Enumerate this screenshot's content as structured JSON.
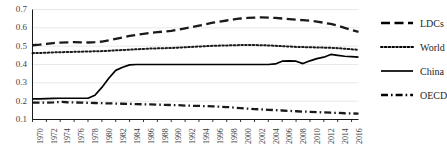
{
  "chart_data": {
    "type": "line",
    "title": "",
    "subtitle": "",
    "xlabel": "",
    "ylabel": "",
    "xlim": [
      1970,
      2017
    ],
    "ylim": [
      0.1,
      0.7
    ],
    "grid": true,
    "grid_axis": "y",
    "legend_position": "right",
    "y_ticks": [
      "0.7",
      "0.6",
      "0.5",
      "0.4",
      "0.3",
      "0.2",
      "0.1"
    ],
    "y_tick_values": [
      0.7,
      0.6,
      0.5,
      0.4,
      0.3,
      0.2,
      0.1
    ],
    "x_ticks": [
      "1970",
      "1972",
      "1974",
      "1976",
      "1978",
      "1980",
      "1982",
      "1984",
      "1986",
      "1988",
      "1990",
      "1992",
      "1994",
      "1996",
      "1998",
      "2000",
      "2002",
      "2004",
      "2006",
      "2008",
      "2010",
      "2012",
      "2014",
      "2016"
    ],
    "x": [
      1970,
      1971,
      1972,
      1973,
      1974,
      1975,
      1976,
      1977,
      1978,
      1979,
      1980,
      1981,
      1982,
      1983,
      1984,
      1985,
      1986,
      1987,
      1988,
      1989,
      1990,
      1991,
      1992,
      1993,
      1994,
      1995,
      1996,
      1997,
      1998,
      1999,
      2000,
      2001,
      2002,
      2003,
      2004,
      2005,
      2006,
      2007,
      2008,
      2009,
      2010,
      2011,
      2012,
      2013,
      2014,
      2015,
      2016,
      2017
    ],
    "series": [
      {
        "name": "LDCs",
        "style": "dashed",
        "color": "#1a1a1a",
        "values": [
          0.505,
          0.508,
          0.512,
          0.517,
          0.519,
          0.521,
          0.522,
          0.521,
          0.52,
          0.522,
          0.525,
          0.532,
          0.54,
          0.548,
          0.556,
          0.562,
          0.567,
          0.572,
          0.576,
          0.58,
          0.584,
          0.59,
          0.597,
          0.604,
          0.612,
          0.62,
          0.628,
          0.634,
          0.64,
          0.646,
          0.651,
          0.654,
          0.656,
          0.657,
          0.656,
          0.654,
          0.651,
          0.648,
          0.644,
          0.642,
          0.639,
          0.634,
          0.628,
          0.621,
          0.612,
          0.6,
          0.588,
          0.578
        ]
      },
      {
        "name": "World",
        "style": "dotted",
        "color": "#1a1a1a",
        "values": [
          0.462,
          0.463,
          0.464,
          0.466,
          0.467,
          0.468,
          0.469,
          0.47,
          0.471,
          0.472,
          0.473,
          0.475,
          0.477,
          0.479,
          0.481,
          0.483,
          0.485,
          0.487,
          0.488,
          0.489,
          0.49,
          0.492,
          0.494,
          0.496,
          0.498,
          0.5,
          0.502,
          0.503,
          0.504,
          0.505,
          0.506,
          0.506,
          0.506,
          0.505,
          0.504,
          0.502,
          0.5,
          0.498,
          0.496,
          0.495,
          0.494,
          0.493,
          0.492,
          0.491,
          0.489,
          0.486,
          0.483,
          0.48
        ]
      },
      {
        "name": "China",
        "style": "solid",
        "color": "#000000",
        "values": [
          0.212,
          0.213,
          0.214,
          0.215,
          0.216,
          0.216,
          0.216,
          0.216,
          0.216,
          0.232,
          0.275,
          0.325,
          0.368,
          0.385,
          0.398,
          0.4,
          0.4,
          0.4,
          0.4,
          0.4,
          0.4,
          0.4,
          0.4,
          0.4,
          0.4,
          0.4,
          0.4,
          0.4,
          0.4,
          0.4,
          0.4,
          0.4,
          0.4,
          0.4,
          0.4,
          0.403,
          0.418,
          0.42,
          0.418,
          0.405,
          0.42,
          0.432,
          0.44,
          0.455,
          0.45,
          0.445,
          0.443,
          0.44
        ]
      },
      {
        "name": "OECD",
        "style": "dashdot",
        "color": "#1a1a1a",
        "values": [
          0.192,
          0.192,
          0.192,
          0.193,
          0.196,
          0.194,
          0.193,
          0.192,
          0.191,
          0.19,
          0.189,
          0.188,
          0.187,
          0.186,
          0.185,
          0.184,
          0.183,
          0.182,
          0.181,
          0.18,
          0.179,
          0.178,
          0.176,
          0.175,
          0.174,
          0.173,
          0.172,
          0.17,
          0.168,
          0.165,
          0.162,
          0.159,
          0.157,
          0.155,
          0.153,
          0.151,
          0.149,
          0.147,
          0.145,
          0.143,
          0.142,
          0.14,
          0.139,
          0.137,
          0.136,
          0.134,
          0.133,
          0.132
        ]
      }
    ]
  },
  "legend": {
    "items": [
      {
        "label": "LDCs",
        "style": "dashed"
      },
      {
        "label": "World",
        "style": "dotted"
      },
      {
        "label": "China",
        "style": "solid"
      },
      {
        "label": "OECD",
        "style": "dashdot"
      }
    ]
  },
  "colors": {
    "axis": "#000000",
    "grid": "#e8e8e8",
    "tick_text": "#3f3f3f",
    "legend_text": "#262626",
    "line": "#000000"
  }
}
